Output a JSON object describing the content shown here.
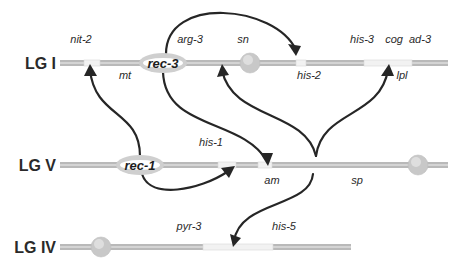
{
  "colors": {
    "bar_dark": "#b9b9b9",
    "bar_light": "#f2f2f2",
    "bar_edge": "#d6d6d6",
    "centromere": "#c8c8c8",
    "rec_oval": "#cfcfcf",
    "arrow": "#262626",
    "text": "#2a2a2a"
  },
  "linkage_groups": [
    {
      "label": "LG I",
      "y": 63,
      "x_start": 60,
      "x_end": 448,
      "centromere_x": 250,
      "rec_locus": {
        "label": "rec-3",
        "x": 163
      },
      "light_segments": [
        [
          84,
          100
        ],
        [
          296,
          306
        ],
        [
          364,
          412
        ]
      ],
      "genes": [
        {
          "label": "nit-2",
          "x": 81,
          "y": 43,
          "side": "above"
        },
        {
          "label": "mt",
          "x": 125,
          "y": 79,
          "side": "below"
        },
        {
          "label": "arg-3",
          "x": 190,
          "y": 43,
          "side": "above"
        },
        {
          "label": "sn",
          "x": 243,
          "y": 43,
          "side": "above"
        },
        {
          "label": "his-2",
          "x": 309,
          "y": 79,
          "side": "below"
        },
        {
          "label": "his-3",
          "x": 362,
          "y": 43,
          "side": "above"
        },
        {
          "label": "cog",
          "x": 394,
          "y": 43,
          "side": "above"
        },
        {
          "label": "ad-3",
          "x": 420,
          "y": 43,
          "side": "above"
        },
        {
          "label": "lpl",
          "x": 402,
          "y": 79,
          "side": "below"
        }
      ]
    },
    {
      "label": "LG V",
      "y": 165,
      "x_start": 60,
      "x_end": 448,
      "centromere_x": 418,
      "rec_locus": {
        "label": "rec-1",
        "x": 140
      },
      "light_segments": [
        [
          218,
          236
        ],
        [
          258,
          272
        ]
      ],
      "genes": [
        {
          "label": "his-1",
          "x": 211,
          "y": 146,
          "side": "above"
        },
        {
          "label": "am",
          "x": 272,
          "y": 184,
          "side": "below"
        },
        {
          "label": "sp",
          "x": 357,
          "y": 184,
          "side": "below"
        }
      ]
    },
    {
      "label": "LG IV",
      "y": 247,
      "x_start": 60,
      "x_end": 351,
      "centromere_x": 101,
      "rec_locus": null,
      "light_segments": [
        [
          203,
          273
        ]
      ],
      "genes": [
        {
          "label": "pyr-3",
          "x": 189,
          "y": 230,
          "side": "above"
        },
        {
          "label": "his-5",
          "x": 284,
          "y": 230,
          "side": "above"
        }
      ]
    }
  ],
  "arrows": [
    {
      "from": "rec-3",
      "to": "his-2 region (LG I)",
      "path": "M166,54 C166,-5 275,5 296,50"
    },
    {
      "from": "rec-3",
      "to": "am (LG V)",
      "path": "M163,72 C165,130 242,118 267,161"
    },
    {
      "from": "rec-1",
      "to": "mt / nit-2 region (LG I)",
      "path": "M140,156 C140,110 95,118 90,70"
    },
    {
      "from": "rec-1",
      "to": "his-1 (LG V)",
      "path": "M142,174 C150,200 200,190 227,172"
    },
    {
      "from": "rec-2",
      "to": "sn / his-2 region (LG I)",
      "path": "M316,156 C305,110 232,120 222,70"
    },
    {
      "from": "rec-2",
      "to": "cog / lpl (LG I)",
      "path": "M316,156 C322,110 380,118 388,70"
    },
    {
      "from": "rec-2",
      "to": "his-5 / pyr-3 (LG IV)",
      "path": "M313,174 C310,208 240,200 234,241"
    }
  ],
  "arrowheads": [
    {
      "points": "296,56 288,44 301,46"
    },
    {
      "points": "268,166 260,153 273,153"
    },
    {
      "points": "90,64 84,76 97,76"
    },
    {
      "points": "235,166 221,168 229,178"
    },
    {
      "points": "222,64 217,77 229,75"
    },
    {
      "points": "389,64 381,76 394,76"
    },
    {
      "points": "233,247 230,234 241,238"
    }
  ]
}
